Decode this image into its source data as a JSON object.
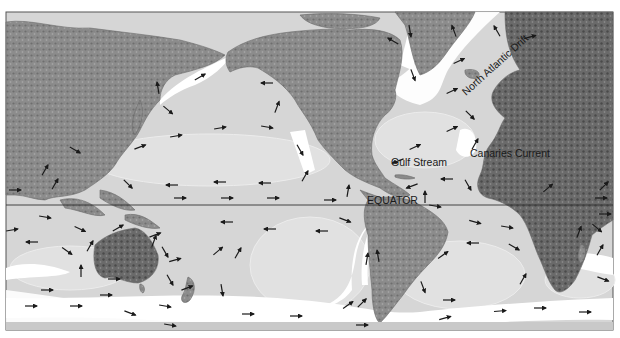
{
  "figure": {
    "type": "world ocean surface currents map",
    "background_color": "#ffffff",
    "ocean_color": "#d6d6d6",
    "gyre_color": "#e0e0e0",
    "land_color": "#8a8a8a",
    "land_dark_color": "#5a5a5a",
    "current_band_color": "#ffffff",
    "frame_color": "#555555",
    "arrow_color": "#1a1a1a"
  },
  "labels": {
    "equator": "EQUATOR",
    "gulf_stream": "Gulf Stream",
    "canaries_current": "Canaries Current",
    "north_atlantic_drift": "North Atlantic Drift"
  },
  "arrows": [
    {
      "x": 200,
      "y": 77,
      "a": -30
    },
    {
      "x": 158,
      "y": 88,
      "a": -100
    },
    {
      "x": 168,
      "y": 110,
      "a": 40
    },
    {
      "x": 140,
      "y": 147,
      "a": -20
    },
    {
      "x": 176,
      "y": 136,
      "a": -10
    },
    {
      "x": 220,
      "y": 128,
      "a": -10
    },
    {
      "x": 267,
      "y": 127,
      "a": 10
    },
    {
      "x": 267,
      "y": 83,
      "a": 180
    },
    {
      "x": 277,
      "y": 107,
      "a": -70
    },
    {
      "x": 300,
      "y": 150,
      "a": 60
    },
    {
      "x": 305,
      "y": 176,
      "a": -60
    },
    {
      "x": 220,
      "y": 182,
      "a": 180
    },
    {
      "x": 265,
      "y": 183,
      "a": 180
    },
    {
      "x": 172,
      "y": 185,
      "a": 180
    },
    {
      "x": 128,
      "y": 184,
      "a": 45
    },
    {
      "x": 75,
      "y": 150,
      "a": 30
    },
    {
      "x": 45,
      "y": 170,
      "a": -60
    },
    {
      "x": 15,
      "y": 190,
      "a": 0
    },
    {
      "x": 55,
      "y": 184,
      "a": -60
    },
    {
      "x": 180,
      "y": 198,
      "a": 0
    },
    {
      "x": 227,
      "y": 198,
      "a": 0
    },
    {
      "x": 273,
      "y": 198,
      "a": 0
    },
    {
      "x": 330,
      "y": 200,
      "a": 0
    },
    {
      "x": 348,
      "y": 191,
      "a": -80
    },
    {
      "x": 412,
      "y": 186,
      "a": 160
    },
    {
      "x": 435,
      "y": 206,
      "a": 10
    },
    {
      "x": 425,
      "y": 197,
      "a": -90
    },
    {
      "x": 447,
      "y": 179,
      "a": 180
    },
    {
      "x": 468,
      "y": 185,
      "a": 60
    },
    {
      "x": 452,
      "y": 129,
      "a": -25
    },
    {
      "x": 415,
      "y": 147,
      "a": -25
    },
    {
      "x": 398,
      "y": 161,
      "a": 160
    },
    {
      "x": 475,
      "y": 144,
      "a": -60
    },
    {
      "x": 470,
      "y": 115,
      "a": 45
    },
    {
      "x": 452,
      "y": 91,
      "a": -25
    },
    {
      "x": 454,
      "y": 31,
      "a": -110
    },
    {
      "x": 410,
      "y": 31,
      "a": 80
    },
    {
      "x": 413,
      "y": 75,
      "a": 70
    },
    {
      "x": 393,
      "y": 41,
      "a": -150
    },
    {
      "x": 459,
      "y": 61,
      "a": -25
    },
    {
      "x": 497,
      "y": 31,
      "a": -120
    },
    {
      "x": 530,
      "y": 37,
      "a": -15
    },
    {
      "x": 601,
      "y": 198,
      "a": 0
    },
    {
      "x": 604,
      "y": 186,
      "a": -45
    },
    {
      "x": 548,
      "y": 188,
      "a": -40
    },
    {
      "x": 45,
      "y": 217,
      "a": 10
    },
    {
      "x": 80,
      "y": 229,
      "a": 25
    },
    {
      "x": 32,
      "y": 242,
      "a": 180
    },
    {
      "x": 67,
      "y": 251,
      "a": 35
    },
    {
      "x": 118,
      "y": 228,
      "a": -30
    },
    {
      "x": 90,
      "y": 246,
      "a": -60
    },
    {
      "x": 155,
      "y": 235,
      "a": -20
    },
    {
      "x": 175,
      "y": 260,
      "a": -15
    },
    {
      "x": 165,
      "y": 252,
      "a": 60
    },
    {
      "x": 218,
      "y": 251,
      "a": -40
    },
    {
      "x": 238,
      "y": 253,
      "a": -60
    },
    {
      "x": 227,
      "y": 222,
      "a": 180
    },
    {
      "x": 270,
      "y": 229,
      "a": 180
    },
    {
      "x": 154,
      "y": 241,
      "a": -70
    },
    {
      "x": 81,
      "y": 271,
      "a": -90
    },
    {
      "x": 114,
      "y": 279,
      "a": 0
    },
    {
      "x": 170,
      "y": 280,
      "a": 60
    },
    {
      "x": 187,
      "y": 288,
      "a": -20
    },
    {
      "x": 222,
      "y": 290,
      "a": 80
    },
    {
      "x": 47,
      "y": 290,
      "a": 0
    },
    {
      "x": 31,
      "y": 306,
      "a": 0
    },
    {
      "x": 76,
      "y": 306,
      "a": 0
    },
    {
      "x": 106,
      "y": 295,
      "a": 0
    },
    {
      "x": 130,
      "y": 313,
      "a": 20
    },
    {
      "x": 165,
      "y": 306,
      "a": 10
    },
    {
      "x": 170,
      "y": 325,
      "a": 10
    },
    {
      "x": 248,
      "y": 314,
      "a": 0
    },
    {
      "x": 296,
      "y": 316,
      "a": 0
    },
    {
      "x": 12,
      "y": 230,
      "a": -10
    },
    {
      "x": 345,
      "y": 220,
      "a": 20
    },
    {
      "x": 322,
      "y": 231,
      "a": 180
    },
    {
      "x": 367,
      "y": 259,
      "a": -80
    },
    {
      "x": 378,
      "y": 256,
      "a": -100
    },
    {
      "x": 348,
      "y": 305,
      "a": -35
    },
    {
      "x": 362,
      "y": 303,
      "a": -45
    },
    {
      "x": 362,
      "y": 325,
      "a": 0
    },
    {
      "x": 423,
      "y": 287,
      "a": 70
    },
    {
      "x": 449,
      "y": 300,
      "a": 0
    },
    {
      "x": 445,
      "y": 318,
      "a": -15
    },
    {
      "x": 500,
      "y": 311,
      "a": -5
    },
    {
      "x": 540,
      "y": 308,
      "a": 0
    },
    {
      "x": 585,
      "y": 312,
      "a": 0
    },
    {
      "x": 443,
      "y": 255,
      "a": -35
    },
    {
      "x": 473,
      "y": 243,
      "a": 180
    },
    {
      "x": 475,
      "y": 222,
      "a": 15
    },
    {
      "x": 507,
      "y": 227,
      "a": 10
    },
    {
      "x": 514,
      "y": 247,
      "a": 30
    },
    {
      "x": 523,
      "y": 279,
      "a": -60
    },
    {
      "x": 579,
      "y": 232,
      "a": -70
    },
    {
      "x": 597,
      "y": 228,
      "a": 40
    },
    {
      "x": 600,
      "y": 250,
      "a": -60
    },
    {
      "x": 603,
      "y": 279,
      "a": 20
    },
    {
      "x": 605,
      "y": 214,
      "a": 0
    }
  ]
}
